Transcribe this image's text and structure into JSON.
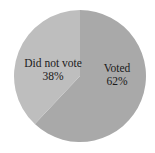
{
  "chart_data": {
    "type": "pie",
    "title": "",
    "categories": [
      "Voted",
      "Did not vote"
    ],
    "values": [
      62,
      38
    ],
    "labels": [
      "Voted\n62%",
      "Did not vote\n38%"
    ],
    "colors": [
      "#a9a9a9",
      "#bebebe"
    ],
    "start_angle_deg": 0,
    "direction": "clockwise",
    "legend": "none (inline labels)"
  },
  "slices": [
    {
      "name": "Voted",
      "pct": "62%",
      "color": "#a9a9a9"
    },
    {
      "name": "Did not vote",
      "pct": "38%",
      "color": "#bebebe"
    }
  ]
}
